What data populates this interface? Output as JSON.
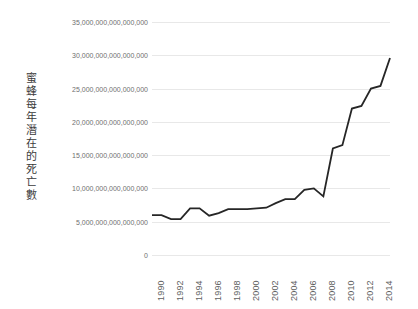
{
  "chart_data": {
    "type": "line",
    "title": "",
    "xlabel": "",
    "ylabel": "蜜蜂每年潛在的死亡數",
    "ylim": [
      0,
      35000000000000000
    ],
    "xlim": [
      1990,
      2015
    ],
    "grid": true,
    "legend": false,
    "legend_position": "none",
    "line_color": "#262626",
    "grid_color": "#e8e8e8",
    "y_tick_labels": [
      "35,000,000,000,000,000",
      "30,000,000,000,000,000",
      "25,000,000,000,000,000",
      "20,000,000,000,000,000",
      "15,000,000,000,000,000",
      "10,000,000,000,000,000",
      "5,000,000,000,000,000",
      "0"
    ],
    "y_tick_values": [
      35000000000000000,
      30000000000000000,
      25000000000000000,
      20000000000000000,
      15000000000000000,
      10000000000000000,
      5000000000000000,
      0
    ],
    "x_tick_labels": [
      "1990",
      "1992",
      "1994",
      "1996",
      "1998",
      "2000",
      "2002",
      "2004",
      "2006",
      "2008",
      "2010",
      "2012",
      "2014"
    ],
    "x_tick_values": [
      1990,
      1992,
      1994,
      1996,
      1998,
      2000,
      2002,
      2004,
      2006,
      2008,
      2010,
      2012,
      2014
    ],
    "x": [
      1990,
      1991,
      1992,
      1993,
      1994,
      1995,
      1996,
      1997,
      1998,
      1999,
      2000,
      2001,
      2002,
      2003,
      2004,
      2005,
      2006,
      2007,
      2008,
      2009,
      2010,
      2011,
      2012,
      2013,
      2014,
      2015
    ],
    "values": [
      6000000000000000,
      6000000000000000,
      5400000000000000,
      5400000000000000,
      7000000000000000,
      7000000000000000,
      5900000000000000,
      6300000000000000,
      6900000000000000,
      6900000000000000,
      6900000000000000,
      7000000000000000,
      7100000000000000,
      7800000000000000,
      8400000000000000,
      8400000000000000,
      9800000000000000,
      10000000000000000,
      8800000000000000,
      16000000000000000,
      16500000000000000,
      22000000000000000,
      22400000000000000,
      25000000000000000,
      25400000000000000,
      29600000000000000
    ]
  }
}
